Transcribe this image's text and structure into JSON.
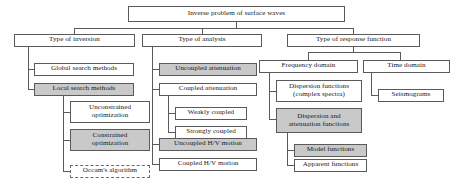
{
  "diagram": {
    "type": "tree-flowchart",
    "title": "Inverse problem of surface waves",
    "legend": {
      "shaded_meaning": "shaded-node",
      "dashed_meaning": "dashed-node"
    },
    "colors": {
      "background": "#fefefe",
      "node_fill": "#ffffff",
      "node_fill_shaded": "#c9c9c9",
      "border": "#5a5a5a",
      "text": "#1a1a1a"
    },
    "nodes": {
      "root": "Inverse problem of surface waves",
      "l1_inversion": "Type of inversion",
      "l1_analysis": "Type of analysis",
      "l1_response": "Type of response function",
      "global_search": "Global search methods",
      "local_search": "Local search methods",
      "unconstrained": "Unconstrained\noptimization",
      "constrained": "Constrained\noptimization",
      "occam": "Occam's algorithm",
      "uncoupled_att": "Uncoupled attenuation",
      "coupled_att": "Coupled attenuation",
      "weakly_coupled": "Weakly coupled",
      "strongly_coupled": "Strongly coupled",
      "uncoupled_hv": "Uncoupled H/V motion",
      "coupled_hv": "Coupled H/V motion",
      "freq_domain": "Frequency domain",
      "time_domain": "Time domain",
      "dispersion_fn": "Dispersion functions\n(complex spectra)",
      "dispersion_att_fn": "Dispersion and\nattenuation functions",
      "model_fn": "Model functions",
      "apparent_fn": "Apparent functions",
      "seismograms": "Seismograms"
    }
  }
}
